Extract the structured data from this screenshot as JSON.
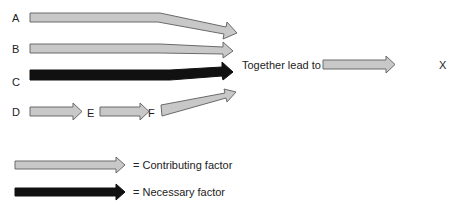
{
  "diagram": {
    "factors": [
      {
        "label": "A",
        "type": "contributing"
      },
      {
        "label": "B",
        "type": "contributing"
      },
      {
        "label": "C",
        "type": "necessary"
      },
      {
        "label": "D",
        "type": "contributing"
      },
      {
        "label": "E",
        "type": "contributing"
      },
      {
        "label": "F",
        "type": "contributing"
      }
    ],
    "together_text": "Together lead to",
    "outcome": "X",
    "colors": {
      "contributing_fill": "#c8c8c8",
      "contributing_stroke": "#6a6a6a",
      "necessary_fill": "#111111"
    }
  },
  "legend": {
    "contributing": "= Contributing factor",
    "necessary": "= Necessary factor"
  }
}
